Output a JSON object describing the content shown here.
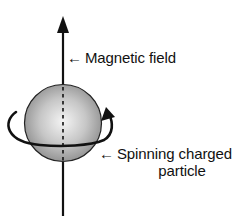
{
  "diagram": {
    "labels": {
      "magnetic_field": {
        "arrow": "←",
        "text": "Magnetic field"
      },
      "particle": {
        "arrow": "←",
        "line1": "Spinning charged",
        "line2": "particle"
      }
    },
    "elements": {
      "field_axis": "vertical arrow pointing up through the particle",
      "particle": "shaded gray sphere",
      "spin_arrow": "curved arrow encircling the sphere",
      "spin_axis": "dashed line through sphere"
    },
    "colors": {
      "stroke": "#111111",
      "sphere_light": "#f2f2f2",
      "sphere_dark": "#8c8c8c",
      "background": "#ffffff"
    }
  }
}
